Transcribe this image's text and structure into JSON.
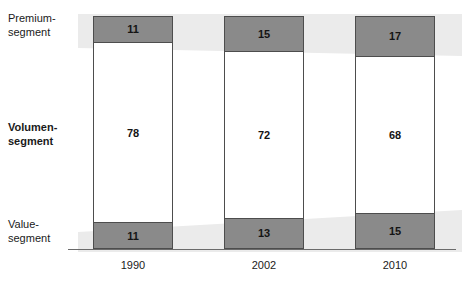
{
  "chart_data": {
    "type": "bar",
    "subtype": "100% stacked column",
    "title": "",
    "subtitle": "",
    "xlabel": "",
    "ylabel": "",
    "categories": [
      "1990",
      "2002",
      "2010"
    ],
    "series": [
      {
        "name": "Premium-segment",
        "values": [
          11,
          15,
          17
        ]
      },
      {
        "name": "Volumen-segment",
        "values": [
          78,
          72,
          68
        ]
      },
      {
        "name": "Value-segment",
        "values": [
          11,
          13,
          15
        ]
      }
    ],
    "stack_order_top_to_bottom": [
      "Premium-segment",
      "Volumen-segment",
      "Value-segment"
    ],
    "ylim": [
      0,
      100
    ],
    "grid": false,
    "legend_position": "left-axis-labels",
    "colors": {
      "premium_fill": "#8a8a8a",
      "volumen_fill": "#ffffff",
      "value_fill": "#8a8a8a",
      "bar_border": "#4d4d4d",
      "band": "#ebebeb",
      "axis": "#6b6b6b",
      "text": "#1a1a1a",
      "background": "#ffffff"
    }
  },
  "axis": {
    "tick_labels": [
      "1990",
      "2002",
      "2010"
    ]
  },
  "segment_labels": {
    "premium": {
      "line1": "Premium-",
      "line2": "segment"
    },
    "volumen": {
      "line1": "Volumen-",
      "line2": "segment"
    },
    "value": {
      "line1": "Value-",
      "line2": "segment"
    }
  },
  "bars": [
    {
      "category": "1990",
      "premium": "11",
      "volumen": "78",
      "value": "11"
    },
    {
      "category": "2002",
      "premium": "15",
      "volumen": "72",
      "value": "13"
    },
    {
      "category": "2010",
      "premium": "17",
      "volumen": "68",
      "value": "15"
    }
  ]
}
